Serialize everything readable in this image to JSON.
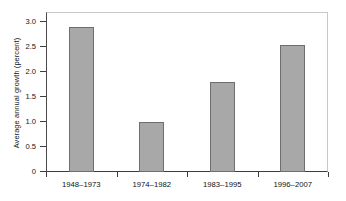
{
  "chart_data": {
    "type": "bar",
    "title": "",
    "xlabel": "",
    "ylabel": "Average annual growth (percent)",
    "categories": [
      "1948–1973",
      "1974–1982",
      "1983–1995",
      "1996–2007"
    ],
    "values": [
      2.9,
      1.0,
      1.8,
      2.55
    ],
    "ylim": [
      0,
      3.2
    ],
    "ytick_values": [
      0,
      0.5,
      1.0,
      1.5,
      2.0,
      2.5,
      3.0
    ],
    "ytick_labels": [
      "0",
      "0.5",
      "1.0",
      "1.5",
      "2.0",
      "2.5",
      "3.0"
    ],
    "grid": false,
    "legend": null,
    "bar_color": "#a8a8a8",
    "bar_edge_color": "#6e6e6e",
    "axis_color": "#3d3d3d",
    "frame_color": "#c9c9c9"
  }
}
